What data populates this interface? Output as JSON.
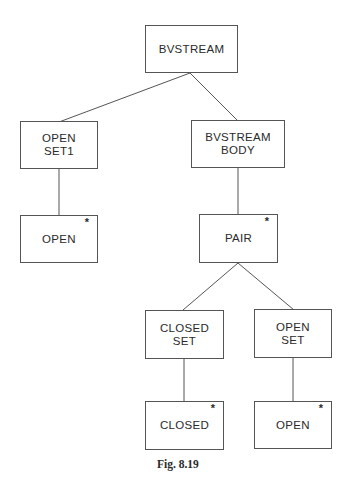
{
  "diagram": {
    "type": "tree",
    "caption": "Fig. 8.19",
    "nodes": {
      "root": {
        "label": "BVSTREAM",
        "iterated": false
      },
      "open_set1": {
        "label": "OPEN\nSET1",
        "iterated": false
      },
      "bvstream_body": {
        "label": "BVSTREAM\nBODY",
        "iterated": false
      },
      "open_leaf": {
        "label": "OPEN",
        "iterated": true,
        "marker": "*"
      },
      "pair": {
        "label": "PAIR",
        "iterated": true,
        "marker": "*"
      },
      "closed_set": {
        "label": "CLOSED\nSET",
        "iterated": false
      },
      "open_set": {
        "label": "OPEN\nSET",
        "iterated": false
      },
      "closed_leaf": {
        "label": "CLOSED",
        "iterated": true,
        "marker": "*"
      },
      "open_leaf2": {
        "label": "OPEN",
        "iterated": true,
        "marker": "*"
      }
    },
    "edges": [
      [
        "BVSTREAM",
        "OPEN SET1"
      ],
      [
        "BVSTREAM",
        "BVSTREAM BODY"
      ],
      [
        "OPEN SET1",
        "OPEN"
      ],
      [
        "BVSTREAM BODY",
        "PAIR"
      ],
      [
        "PAIR",
        "CLOSED SET"
      ],
      [
        "PAIR",
        "OPEN SET"
      ],
      [
        "CLOSED SET",
        "CLOSED"
      ],
      [
        "OPEN SET",
        "OPEN"
      ]
    ]
  }
}
